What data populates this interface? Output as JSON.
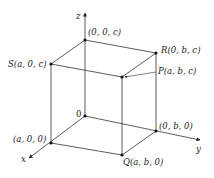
{
  "diagram": {
    "type": "3d-rectangular-box",
    "colors": {
      "line": "#333333",
      "point": "#111111",
      "text": "#222222",
      "background": "#ffffff"
    },
    "axes": {
      "x": {
        "label": "x"
      },
      "y": {
        "label": "y"
      },
      "z": {
        "label": "z"
      }
    },
    "points": {
      "origin": {
        "label": "0"
      },
      "z_top": {
        "label": "(0, 0, c)"
      },
      "S": {
        "label": "S(a, 0, c)"
      },
      "R": {
        "label": "R(0, b, c)"
      },
      "P": {
        "label": "P(a, b, c)"
      },
      "x_point": {
        "label": "(a, 0, 0)"
      },
      "y_point": {
        "label": "(0, b, 0)"
      },
      "Q": {
        "label": "Q(a, b, 0)"
      }
    }
  }
}
